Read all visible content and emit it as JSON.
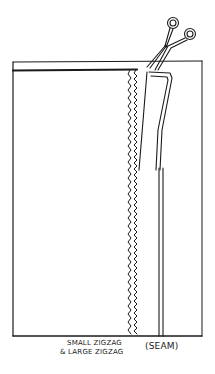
{
  "figure": {
    "colors": {
      "line": "#1a1a1a",
      "background": "#ffffff"
    }
  },
  "labels": {
    "zigzag_line1": "SMALL ZIGZAG",
    "zigzag_line2": "& LARGE ZIGZAG",
    "seam": "(SEAM)"
  }
}
